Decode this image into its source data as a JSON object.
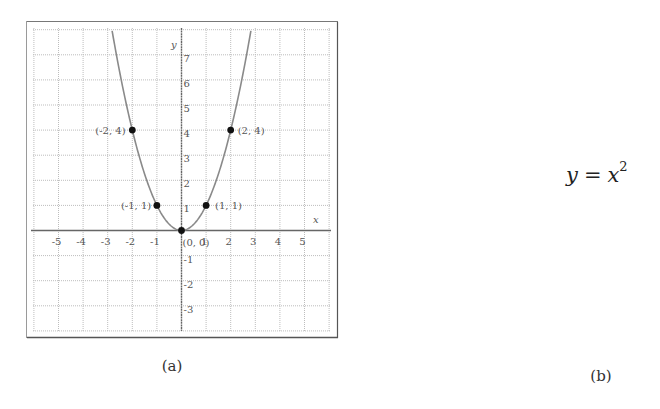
{
  "chart_data": {
    "type": "line",
    "title": "",
    "function": "y = x^2",
    "xlabel": "x",
    "ylabel": "y",
    "xlim": [
      -5.9,
      5.9
    ],
    "ylim": [
      -3.9,
      7.9
    ],
    "grid": true,
    "grid_style": "dotted",
    "x_ticks": [
      -5,
      -4,
      -3,
      -2,
      -1,
      1,
      2,
      3,
      4,
      5
    ],
    "x_tick_labels": [
      "-5",
      "-4",
      "-3",
      "-2",
      "-1",
      "1",
      "2",
      "3",
      "4",
      "5"
    ],
    "y_ticks": [
      -3,
      -2,
      -1,
      1,
      2,
      3,
      4,
      5,
      6,
      7
    ],
    "y_tick_labels": [
      "-3",
      "-2",
      "-1",
      "1",
      "2",
      "3",
      "4",
      "5",
      "6",
      "7"
    ],
    "series": [
      {
        "name": "y = x^2",
        "x": [
          -2.82,
          -2.5,
          -2,
          -1.5,
          -1,
          -0.5,
          0,
          0.5,
          1,
          1.5,
          2,
          2.5,
          2.82
        ],
        "values": [
          7.95,
          6.25,
          4,
          2.25,
          1,
          0.25,
          0,
          0.25,
          1,
          2.25,
          4,
          6.25,
          7.95
        ],
        "color": "#8a8a8a"
      }
    ],
    "points": [
      {
        "x": -2,
        "y": 4,
        "label": "(-2, 4)"
      },
      {
        "x": -1,
        "y": 1,
        "label": "(-1, 1)"
      },
      {
        "x": 0,
        "y": 0,
        "label": "(0, 0)"
      },
      {
        "x": 1,
        "y": 1,
        "label": "(1, 1)"
      },
      {
        "x": 2,
        "y": 4,
        "label": "(2, 4)"
      }
    ],
    "annotations": [
      "(-2, 4)",
      "(-1, 1)",
      "(0, 0)",
      "(1, 1)",
      "(2, 4)"
    ]
  },
  "figure": {
    "caption_a": "(a)",
    "caption_b": "(b)",
    "equation": {
      "lhs": "y",
      "op": "=",
      "rhs_base": "x",
      "rhs_exp": "2"
    }
  },
  "colors": {
    "frame": "#555555",
    "grid": "#bdbdbd",
    "axis": "#666666",
    "curve": "#8a8a8a",
    "point": "#111111",
    "label": "#555555"
  }
}
